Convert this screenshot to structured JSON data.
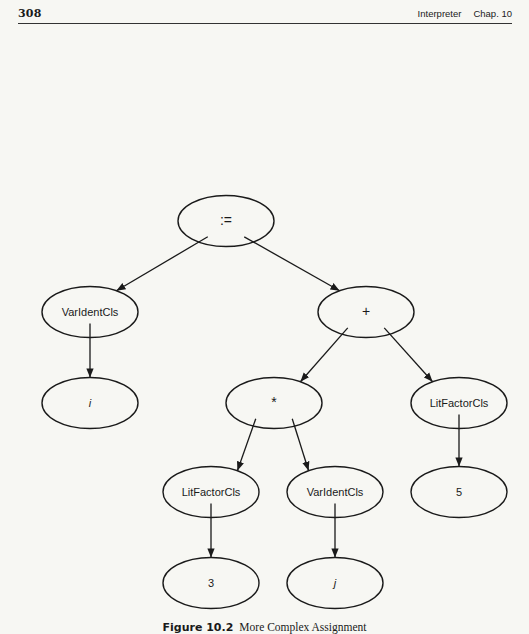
{
  "header": {
    "page_number": "308",
    "section": "Interpreter",
    "chapter": "Chap. 10"
  },
  "figure": {
    "nodes": [
      {
        "id": "assign",
        "label": ":=",
        "cx": 226,
        "cy": 221,
        "style": "sym"
      },
      {
        "id": "varident-i",
        "label": "VarIdentCls",
        "cx": 90,
        "cy": 312,
        "style": "normal"
      },
      {
        "id": "plus",
        "label": "+",
        "cx": 366,
        "cy": 312,
        "style": "sym"
      },
      {
        "id": "leaf-i",
        "label": "i",
        "cx": 90,
        "cy": 403,
        "style": "ital"
      },
      {
        "id": "times",
        "label": "*",
        "cx": 274,
        "cy": 403,
        "style": "sym"
      },
      {
        "id": "litfactor-5",
        "label": "LitFactorCls",
        "cx": 459,
        "cy": 403,
        "style": "normal"
      },
      {
        "id": "litfactor-3",
        "label": "LitFactorCls",
        "cx": 211,
        "cy": 492,
        "style": "normal"
      },
      {
        "id": "varident-j",
        "label": "VarIdentCls",
        "cx": 335,
        "cy": 492,
        "style": "normal"
      },
      {
        "id": "leaf-5",
        "label": "5",
        "cx": 459,
        "cy": 492,
        "style": "normal"
      },
      {
        "id": "leaf-3",
        "label": "3",
        "cx": 211,
        "cy": 583,
        "style": "normal"
      },
      {
        "id": "leaf-j",
        "label": "j",
        "cx": 335,
        "cy": 583,
        "style": "ital"
      }
    ],
    "edges": [
      {
        "from": "assign",
        "to": "varident-i"
      },
      {
        "from": "assign",
        "to": "plus"
      },
      {
        "from": "varident-i",
        "to": "leaf-i"
      },
      {
        "from": "plus",
        "to": "times"
      },
      {
        "from": "plus",
        "to": "litfactor-5"
      },
      {
        "from": "times",
        "to": "litfactor-3"
      },
      {
        "from": "times",
        "to": "varident-j"
      },
      {
        "from": "litfactor-5",
        "to": "leaf-5"
      },
      {
        "from": "litfactor-3",
        "to": "leaf-3"
      },
      {
        "from": "varident-j",
        "to": "leaf-j"
      }
    ],
    "node_rx": 48,
    "node_ry": 25.5,
    "stroke_color": "#1a1a1a"
  },
  "caption": {
    "number": "Figure 10.2",
    "text": "More Complex Assignment"
  }
}
